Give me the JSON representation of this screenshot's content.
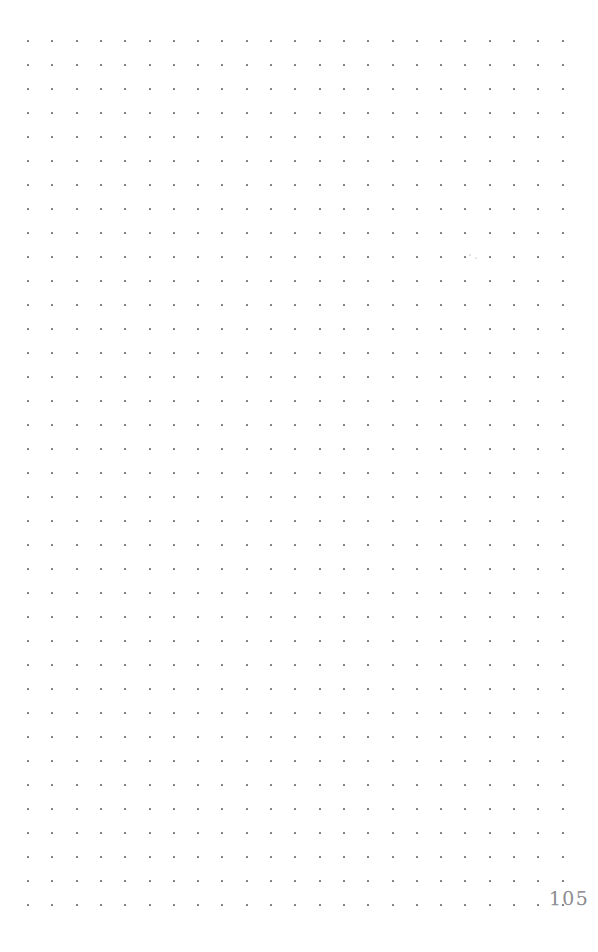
{
  "page": {
    "kind": "dot-grid-notebook-page",
    "width": 598,
    "height": 952,
    "background_color": "#ffffff",
    "page_number": "105"
  },
  "grid": {
    "columns": 23,
    "rows": 37,
    "origin_x": 28,
    "origin_y": 41,
    "spacing_x": 24.3,
    "spacing_y": 24.0,
    "dot_size_px": 2,
    "dot_color": "#5a5a66"
  },
  "marks": {
    "specks": [
      {
        "x": 476,
        "y": 258,
        "size": 1.6
      },
      {
        "x": 470,
        "y": 255,
        "size": 1.2
      }
    ]
  },
  "chart_data": {
    "type": "scatter",
    "title": "",
    "subtitle": "",
    "xlabel": "",
    "ylabel": "",
    "grid": true,
    "legend": "none",
    "xlim": [
      28,
      562
    ],
    "ylim": [
      41,
      905
    ],
    "annotations": [
      {
        "text": "105",
        "x": 556,
        "y": 902
      }
    ]
  }
}
